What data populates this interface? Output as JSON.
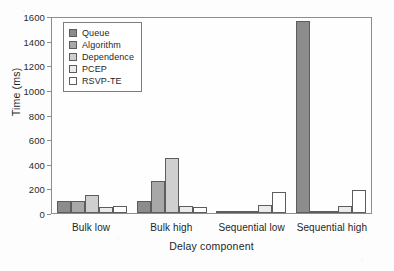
{
  "chart_data": {
    "type": "bar",
    "title": "",
    "subtitle": "",
    "xlabel": "Delay component",
    "ylabel": "Time (ms)",
    "categories": [
      "Bulk low",
      "Bulk high",
      "Sequential low",
      "Sequential high"
    ],
    "series": [
      {
        "name": "Queue",
        "values": [
          100,
          95,
          5,
          1560
        ],
        "color": "#8c8c8c"
      },
      {
        "name": "Algorithm",
        "values": [
          95,
          263,
          4,
          6
        ],
        "color": "#a8a8a8"
      },
      {
        "name": "Dependence",
        "values": [
          145,
          447,
          2,
          2
        ],
        "color": "#cfcfcf"
      },
      {
        "name": "PCEP",
        "values": [
          48,
          58,
          63,
          58
        ],
        "color": "#ebebeb"
      },
      {
        "name": "RSVP-TE",
        "values": [
          58,
          50,
          172,
          183
        ],
        "color": "#ffffff"
      }
    ],
    "ylim": [
      0,
      1600
    ],
    "yticks": [
      0,
      200,
      400,
      600,
      800,
      1000,
      1200,
      1400,
      1600
    ],
    "ytick_labels": [
      "0",
      "200",
      "400",
      "600",
      "800",
      "1000",
      "1200",
      "1400",
      "1600"
    ],
    "grid": false,
    "legend_position": "upper left",
    "legend_entries": [
      "Queue",
      "Algorithm",
      "Dependence",
      "PCEP",
      "RSVP-TE"
    ],
    "axis_color": "#8d8d8d",
    "bar_edge_color": "#5d5d5d",
    "background_color": "#fdfdfd"
  }
}
